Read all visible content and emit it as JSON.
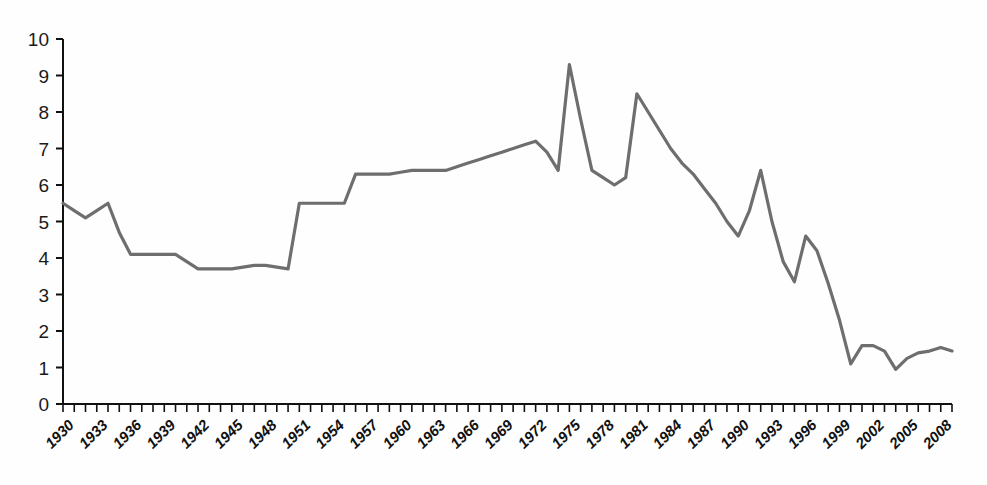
{
  "chart_data": {
    "type": "line",
    "title": "",
    "subtitle": "",
    "xlabel": "",
    "ylabel": "",
    "xlim": [
      1930,
      2009
    ],
    "ylim": [
      0,
      10
    ],
    "grid": false,
    "legend": null,
    "legend_position": "none",
    "annotations": [],
    "line_color": "#6e6e6e",
    "axis_color": "#111111",
    "background_color": "#fefefe",
    "y_ticks": [
      0,
      1,
      2,
      3,
      4,
      5,
      6,
      7,
      8,
      9,
      10
    ],
    "y_tick_labels": [
      "0",
      "1",
      "2",
      "3",
      "4",
      "5",
      "6",
      "7",
      "8",
      "9",
      "10"
    ],
    "x_tick_labels": [
      "1930",
      "1933",
      "1936",
      "1939",
      "1942",
      "1945",
      "1948",
      "1951",
      "1954",
      "1957",
      "1960",
      "1963",
      "1966",
      "1969",
      "1972",
      "1975",
      "1978",
      "1981",
      "1984",
      "1987",
      "1990",
      "1993",
      "1996",
      "1999",
      "2002",
      "2005",
      "2008"
    ],
    "x_tick_label_step": 3,
    "x_minor_tick_step": 1,
    "x": [
      1930,
      1931,
      1932,
      1933,
      1934,
      1935,
      1936,
      1937,
      1938,
      1939,
      1940,
      1941,
      1942,
      1943,
      1944,
      1945,
      1946,
      1947,
      1948,
      1949,
      1950,
      1951,
      1952,
      1953,
      1954,
      1955,
      1956,
      1957,
      1958,
      1959,
      1960,
      1961,
      1962,
      1963,
      1964,
      1965,
      1966,
      1967,
      1968,
      1969,
      1970,
      1971,
      1972,
      1973,
      1974,
      1975,
      1976,
      1977,
      1978,
      1979,
      1980,
      1981,
      1982,
      1983,
      1984,
      1985,
      1986,
      1987,
      1988,
      1989,
      1990,
      1991,
      1992,
      1993,
      1994,
      1995,
      1996,
      1997,
      1998,
      1999,
      2000,
      2001,
      2002,
      2003,
      2004,
      2005,
      2006,
      2007,
      2008,
      2009
    ],
    "series": [
      {
        "name": "value",
        "values": [
          5.5,
          5.3,
          5.1,
          5.3,
          5.5,
          4.7,
          4.1,
          4.1,
          4.1,
          4.1,
          4.1,
          3.9,
          3.7,
          3.7,
          3.7,
          3.7,
          3.75,
          3.8,
          3.8,
          3.75,
          3.7,
          5.5,
          5.5,
          5.5,
          5.5,
          5.5,
          6.3,
          6.3,
          6.3,
          6.3,
          6.35,
          6.4,
          6.4,
          6.4,
          6.4,
          6.5,
          6.6,
          6.7,
          6.8,
          6.9,
          7.0,
          7.1,
          7.2,
          6.9,
          6.4,
          9.3,
          7.8,
          6.4,
          6.2,
          6.0,
          6.2,
          8.5,
          8.0,
          7.5,
          7.0,
          6.6,
          6.3,
          5.9,
          5.5,
          5.0,
          4.6,
          5.3,
          6.4,
          5.0,
          3.9,
          3.35,
          4.6,
          4.2,
          3.3,
          2.3,
          1.1,
          1.6,
          1.6,
          1.45,
          0.95,
          1.25,
          1.4,
          1.45,
          1.55,
          1.45
        ]
      }
    ]
  }
}
